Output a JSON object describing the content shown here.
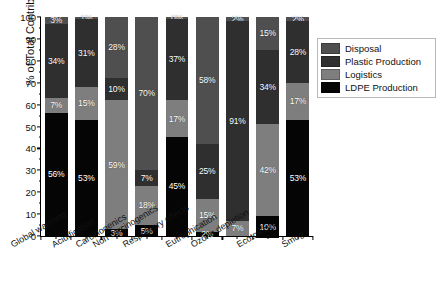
{
  "chart_data": {
    "type": "bar",
    "stacked": true,
    "normalized_percent": true,
    "title": "",
    "xlabel": "",
    "ylabel": "% of Total Contribution",
    "ylim": [
      0,
      100
    ],
    "ytick_step": 10,
    "grid": false,
    "legend_position": "top-right",
    "categories": [
      "Global warming",
      "Acidification",
      "Carcinogenics",
      "Non carcinogenics",
      "Respiratory effects",
      "Eutrophication",
      "Ozone depletion",
      "Ecotoxicity",
      "Smog"
    ],
    "ytick_labels": [
      "0",
      "10",
      "20",
      "30",
      "40",
      "50",
      "60",
      "70",
      "80",
      "90",
      "100"
    ],
    "series": [
      {
        "name": "Disposal",
        "color": "#4f4f4f",
        "values": [
          3,
          1,
          28,
          70,
          1,
          58,
          2,
          15,
          2
        ],
        "labels": [
          "3%",
          "1%",
          "28%",
          "70%",
          "0%",
          "58%",
          "2%",
          "15%",
          "2%"
        ]
      },
      {
        "name": "Plastic Production",
        "color": "#2f2f2f",
        "values": [
          34,
          31,
          10,
          7,
          37,
          25,
          91,
          34,
          28
        ],
        "labels": [
          "34%",
          "31%",
          "10%",
          "7%",
          "37%",
          "25%",
          "91%",
          "34%",
          "28%"
        ]
      },
      {
        "name": "Logistics",
        "color": "#7e7e7e",
        "values": [
          7,
          15,
          59,
          18,
          17,
          15,
          7,
          42,
          17
        ],
        "labels": [
          "7%",
          "15%",
          "59%",
          "18%",
          "17%",
          "15%",
          "7%",
          "42%",
          "17%"
        ]
      },
      {
        "name": "LDPE Production",
        "color": "#050505",
        "values": [
          56,
          53,
          3,
          5,
          45,
          2,
          0,
          10,
          53
        ],
        "labels": [
          "56%",
          "53%",
          "3%",
          "5%",
          "45%",
          "2%",
          "",
          "10%",
          "53%"
        ]
      }
    ]
  },
  "legend": {
    "items": [
      {
        "label": "Disposal"
      },
      {
        "label": "Plastic Production"
      },
      {
        "label": "Logistics"
      },
      {
        "label": "LDPE Production"
      }
    ]
  },
  "caption": {
    "text": ""
  }
}
